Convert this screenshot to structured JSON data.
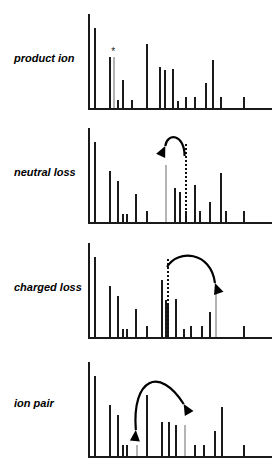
{
  "figure": {
    "title": "",
    "panel_count": 4,
    "background_color": "#ffffff",
    "peak_color": "#1a1a1a",
    "highlight_color": "#b4b4b4",
    "arrow_color": "#000000"
  },
  "chart_data": {
    "type": "bar",
    "title": "",
    "xlabel": "",
    "ylabel": "",
    "grid": false,
    "legend": "none",
    "panels": [
      {
        "label": "product ion",
        "xlim": [
          0,
          100
        ],
        "ylim": [
          0,
          100
        ],
        "marker": {
          "symbol": "*",
          "x": 11.5,
          "y": 66
        },
        "x": [
          3.5,
          11.5,
          13.5,
          15.5,
          18.5,
          23.5,
          31.5,
          38.5,
          41.5,
          45.5,
          48.5,
          52.5,
          57.5,
          63.5,
          67.5,
          71.5,
          84.5
        ],
        "values": [
          97,
          62,
          62,
          10,
          34,
          10,
          78,
          50,
          46,
          48,
          8,
          13,
          13,
          31,
          58,
          13,
          13
        ],
        "colors": [
          "black",
          "black",
          "gray",
          "black",
          "black",
          "black",
          "black",
          "black",
          "black",
          "black",
          "black",
          "black",
          "black",
          "black",
          "black",
          "black",
          "black"
        ]
      },
      {
        "label": "neutral loss",
        "xlim": [
          0,
          100
        ],
        "ylim": [
          0,
          100
        ],
        "dotted_line_x": 52.5,
        "annotation": {
          "type": "curved-arrow",
          "from_x": 52.5,
          "to_x": 42.0,
          "direction": "left"
        },
        "x": [
          3.5,
          11.5,
          15.5,
          18.5,
          20.5,
          25.5,
          31.5,
          42.0,
          46.5,
          49.5,
          52.5,
          57.5,
          60.5,
          65.5,
          71.5,
          74.5,
          84.5
        ],
        "values": [
          97,
          62,
          50,
          10,
          10,
          34,
          13,
          70,
          42,
          36,
          13,
          45,
          13,
          25,
          60,
          13,
          13
        ],
        "colors": [
          "black",
          "black",
          "black",
          "black",
          "black",
          "black",
          "black",
          "gray",
          "black",
          "black",
          "black",
          "black",
          "black",
          "black",
          "black",
          "black",
          "black"
        ]
      },
      {
        "label": "charged loss",
        "xlim": [
          0,
          100
        ],
        "ylim": [
          0,
          100
        ],
        "dotted_line_x": 43.0,
        "annotation": {
          "type": "curved-arrow",
          "from_x": 43.0,
          "to_x": 69.0,
          "direction": "right"
        },
        "x": [
          3.5,
          11.5,
          15.5,
          18.5,
          20.5,
          25.5,
          31.5,
          39.5,
          42.0,
          43.0,
          47.5,
          51.5,
          55.5,
          61.5,
          65.5,
          69.0,
          84.5
        ],
        "values": [
          97,
          62,
          50,
          10,
          10,
          34,
          13,
          70,
          45,
          40,
          46,
          10,
          13,
          13,
          30,
          55,
          13
        ],
        "colors": [
          "black",
          "black",
          "black",
          "black",
          "black",
          "black",
          "black",
          "black",
          "black",
          "black",
          "black",
          "black",
          "black",
          "black",
          "black",
          "gray",
          "black"
        ]
      },
      {
        "label": "ion pair",
        "xlim": [
          0,
          100
        ],
        "ylim": [
          0,
          100
        ],
        "annotation": {
          "type": "double-curved-arrow",
          "from_x": 26.0,
          "to_x": 52.0,
          "direction": "both"
        },
        "x": [
          3.5,
          11.5,
          15.5,
          18.5,
          20.5,
          26.0,
          31.5,
          39.5,
          43.5,
          47.5,
          52.0,
          57.5,
          62.5,
          68.5,
          72.5,
          84.5
        ],
        "values": [
          97,
          62,
          50,
          13,
          13,
          13,
          75,
          42,
          42,
          38,
          38,
          13,
          13,
          30,
          60,
          13
        ],
        "colors": [
          "black",
          "black",
          "black",
          "black",
          "black",
          "gray",
          "black",
          "black",
          "black",
          "black",
          "gray",
          "black",
          "black",
          "black",
          "black",
          "black"
        ]
      }
    ]
  }
}
